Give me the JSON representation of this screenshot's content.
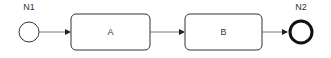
{
  "diagram": {
    "type": "bpmn-process",
    "nodes": [
      {
        "id": "start",
        "kind": "start-event",
        "label": "N1"
      },
      {
        "id": "A",
        "kind": "task",
        "label": "A"
      },
      {
        "id": "B",
        "kind": "task",
        "label": "B"
      },
      {
        "id": "end",
        "kind": "end-event",
        "label": "N2"
      }
    ],
    "edges": [
      {
        "from": "start",
        "to": "A"
      },
      {
        "from": "A",
        "to": "B"
      },
      {
        "from": "B",
        "to": "end"
      }
    ],
    "colors": {
      "stroke": "#222222",
      "fill": "#ffffff",
      "text": "#333333",
      "edge": "#555555"
    }
  }
}
